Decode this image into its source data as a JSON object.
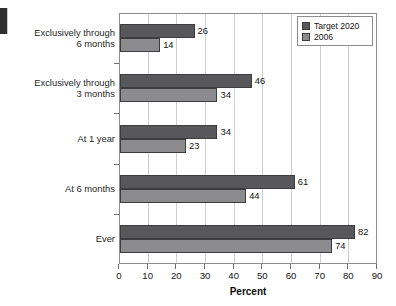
{
  "chart_data": {
    "type": "bar",
    "orientation": "horizontal",
    "title": "",
    "xlabel": "Percent",
    "ylabel": "",
    "xlim": [
      0,
      90
    ],
    "xticks": [
      0,
      10,
      20,
      30,
      40,
      50,
      60,
      70,
      80,
      90
    ],
    "grid": true,
    "grid_axis": "x",
    "legend_position": "top-right",
    "categories": [
      "Exclusively through\n6 months",
      "Exclusively through\n3 months",
      "At 1 year",
      "At 6 months",
      "Ever"
    ],
    "series": [
      {
        "name": "Target 2020",
        "color": "#58585a",
        "values": [
          26,
          46,
          34,
          61,
          82
        ]
      },
      {
        "name": "2006",
        "color": "#8c8c8e",
        "values": [
          14,
          34,
          23,
          44,
          74
        ]
      }
    ]
  },
  "legend": {
    "entries": [
      {
        "label": "Target 2020",
        "swatch": "target"
      },
      {
        "label": "2006",
        "swatch": "base"
      }
    ]
  },
  "axis": {
    "x_title": "Percent",
    "x_tick_labels": [
      "0",
      "10",
      "20",
      "30",
      "40",
      "50",
      "60",
      "70",
      "80",
      "90"
    ]
  },
  "categories": [
    {
      "label": "Exclusively through\n6 months",
      "target": "26",
      "base": "14"
    },
    {
      "label": "Exclusively through\n3 months",
      "target": "46",
      "base": "34"
    },
    {
      "label": "At 1 year",
      "target": "34",
      "base": "23"
    },
    {
      "label": "At 6 months",
      "target": "61",
      "base": "44"
    },
    {
      "label": "Ever",
      "target": "82",
      "base": "74"
    }
  ],
  "colors": {
    "target_2020": "#58585a",
    "year_2006": "#8c8c8e",
    "grid": "#cfcfcf",
    "frame": "#8d8d8d"
  }
}
